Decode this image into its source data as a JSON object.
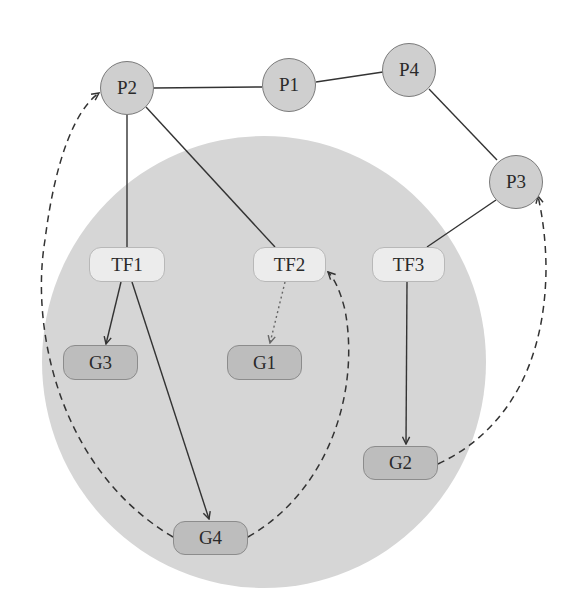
{
  "diagram": {
    "region": {
      "shape": "ellipse",
      "cx": 264,
      "cy": 362,
      "rx": 222,
      "ry": 226,
      "fill": "#d6d6d6"
    },
    "colors": {
      "circle_fill": "#cfcfcf",
      "tf_fill": "#ececec",
      "g_fill": "#bdbdbd",
      "edge": "#333333"
    },
    "nodes": {
      "P2": {
        "label": "P2",
        "type": "protein"
      },
      "P1": {
        "label": "P1",
        "type": "protein"
      },
      "P4": {
        "label": "P4",
        "type": "protein"
      },
      "P3": {
        "label": "P3",
        "type": "protein"
      },
      "TF1": {
        "label": "TF1",
        "type": "transcription-factor"
      },
      "TF2": {
        "label": "TF2",
        "type": "transcription-factor"
      },
      "TF3": {
        "label": "TF3",
        "type": "transcription-factor"
      },
      "G3": {
        "label": "G3",
        "type": "gene"
      },
      "G1": {
        "label": "G1",
        "type": "gene"
      },
      "G2": {
        "label": "G2",
        "type": "gene"
      },
      "G4": {
        "label": "G4",
        "type": "gene"
      }
    },
    "edges": [
      {
        "from": "P2",
        "to": "P1",
        "style": "solid",
        "arrow": false
      },
      {
        "from": "P1",
        "to": "P4",
        "style": "solid",
        "arrow": false
      },
      {
        "from": "P4",
        "to": "P3",
        "style": "solid",
        "arrow": false
      },
      {
        "from": "P2",
        "to": "TF1",
        "style": "solid",
        "arrow": false
      },
      {
        "from": "P2",
        "to": "TF2",
        "style": "solid",
        "arrow": false
      },
      {
        "from": "P3",
        "to": "TF3",
        "style": "solid",
        "arrow": false
      },
      {
        "from": "TF1",
        "to": "G3",
        "style": "solid",
        "arrow": true
      },
      {
        "from": "TF1",
        "to": "G4",
        "style": "solid",
        "arrow": true
      },
      {
        "from": "TF2",
        "to": "G1",
        "style": "dotted",
        "arrow": true
      },
      {
        "from": "TF3",
        "to": "G2",
        "style": "solid",
        "arrow": true
      },
      {
        "from": "G4",
        "to": "P2",
        "style": "dashed",
        "arrow": true
      },
      {
        "from": "G4",
        "to": "TF2",
        "style": "dashed",
        "arrow": true
      },
      {
        "from": "G2",
        "to": "P3",
        "style": "dashed",
        "arrow": true
      }
    ]
  }
}
